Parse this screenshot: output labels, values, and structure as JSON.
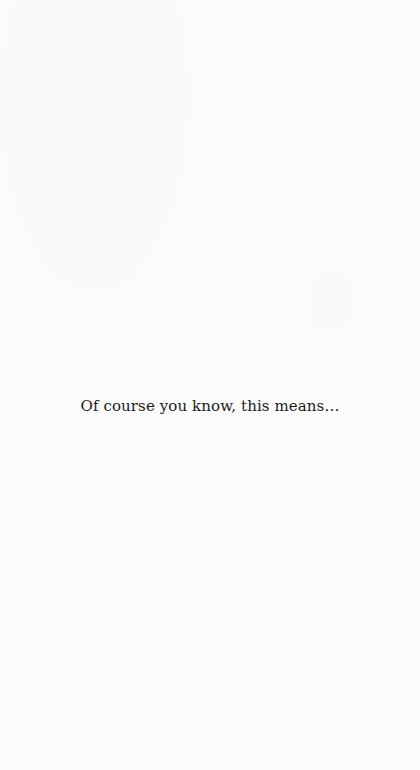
{
  "page": {
    "background_color": "#fcfcfc",
    "text_color": "#1a1a1a",
    "body_text": "Of course you know, this means…"
  }
}
